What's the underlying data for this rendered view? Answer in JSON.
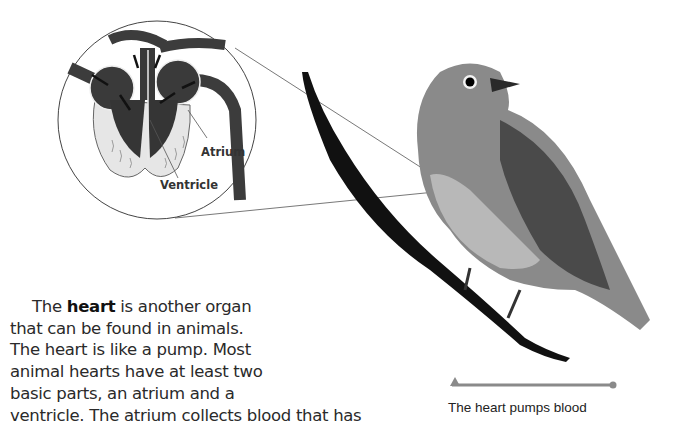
{
  "diagram": {
    "labels": {
      "atrium": "Atrium",
      "ventricle": "Ventricle"
    }
  },
  "text": {
    "line1_before": "The ",
    "line1_bold": "heart",
    "line1_after": " is another organ",
    "line2": "that can be found in animals.",
    "line3": "The heart is like a pump. Most",
    "line4": "animal hearts have at least two",
    "line5": "basic parts, an atrium and a",
    "line6": "ventricle. The atrium collects blood that has"
  },
  "caption": {
    "text": "The heart pumps blood",
    "indicator_color": "#8a8a8a"
  },
  "colors": {
    "heart_dark": "#3a3a3a",
    "heart_light": "#e8e8e8",
    "branch": "#111111",
    "bird_body": "#8c8c8c"
  }
}
